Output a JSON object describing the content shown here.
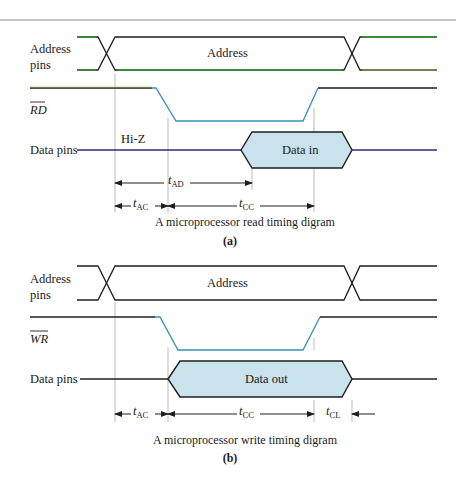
{
  "figure_a": {
    "signals": {
      "address_label_line1": "Address",
      "address_label_line2": "pins",
      "address_bus_text": "Address",
      "control_label": "RD",
      "data_label": "Data pins",
      "hiz_label": "Hi-Z",
      "data_block_text": "Data in"
    },
    "timings": {
      "t_ad": {
        "t": "t",
        "sub": "AD"
      },
      "t_ac": {
        "t": "t",
        "sub": "AC"
      },
      "t_cc": {
        "t": "t",
        "sub": "CC"
      }
    },
    "caption": "A microprocessor read timing digram",
    "panel_label": "(a)"
  },
  "figure_b": {
    "signals": {
      "address_label_line1": "Address",
      "address_label_line2": "pins",
      "address_bus_text": "Address",
      "control_label": "WR",
      "data_label": "Data pins",
      "data_block_text": "Data out"
    },
    "timings": {
      "t_ac": {
        "t": "t",
        "sub": "AC"
      },
      "t_cc": {
        "t": "t",
        "sub": "CC"
      },
      "t_cl": {
        "t": "t",
        "sub": "CL"
      }
    },
    "caption": "A microprocessor write timing digram",
    "panel_label": "(b)"
  },
  "colors": {
    "line": "#1e1e1e",
    "address_green": "#3a9a3a",
    "control_blue": "#3a8fb8",
    "data_navy": "#2a2a7a",
    "data_fill": "#c9e2ec",
    "guide": "#aaaaaa",
    "top_rule": "#8a8a8a"
  }
}
